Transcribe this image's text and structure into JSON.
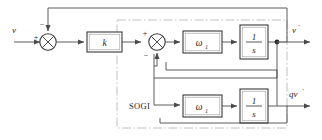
{
  "diagram": {
    "region_label": "SOGI",
    "inputs": [
      {
        "name": "v",
        "label": "v"
      }
    ],
    "outputs": [
      {
        "name": "v-prime",
        "label": "v",
        "prime": "′"
      },
      {
        "name": "qv-prime",
        "label": "qv",
        "prime": "′"
      }
    ],
    "blocks": [
      {
        "name": "gain-k",
        "label": "k"
      },
      {
        "name": "omega1-top",
        "label": "ω",
        "sub": "1"
      },
      {
        "name": "integrator-top",
        "num": "1",
        "den": "s"
      },
      {
        "name": "omega1-bottom",
        "label": "ω",
        "sub": "1"
      },
      {
        "name": "integrator-bottom",
        "num": "1",
        "den": "s"
      }
    ],
    "summers": [
      {
        "name": "summing-junction-input",
        "signs": {
          "left": "+",
          "top": "−"
        }
      },
      {
        "name": "summing-junction-inner",
        "signs": {
          "left": "+",
          "bottom": "−"
        }
      }
    ],
    "colors": {
      "wire": "#4a4a4a",
      "block_stroke": "#3a3a3a",
      "boundary": "#b9b9b9",
      "text": "#1d1d1d",
      "background": "#ffffff"
    }
  }
}
